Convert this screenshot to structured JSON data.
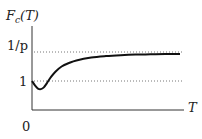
{
  "chart_data": {
    "type": "line",
    "title": "",
    "ylabel": "F_c(T)",
    "ylabel_main": "F",
    "ylabel_sub": "c",
    "ylabel_arg": "(T)",
    "xlabel": "T",
    "origin_label": "0",
    "ytick_labels": [
      "1",
      "1/p"
    ],
    "reference_lines": [
      {
        "label": "1",
        "y": 1.0,
        "style": "dotted"
      },
      {
        "label": "1/p",
        "y": 2.0,
        "style": "dotted"
      }
    ],
    "xlim": [
      0,
      10
    ],
    "ylim": [
      0,
      2.8
    ],
    "grid": false,
    "series": [
      {
        "name": "F_c(T)",
        "x": [
          0,
          0.2,
          0.4,
          0.6,
          0.8,
          1.0,
          1.3,
          1.6,
          2.0,
          2.5,
          3.0,
          4.0,
          5.0,
          6.0,
          7.0,
          8.0,
          9.0,
          10.0
        ],
        "y": [
          1.0,
          0.85,
          0.74,
          0.72,
          0.78,
          0.92,
          1.15,
          1.33,
          1.5,
          1.62,
          1.71,
          1.81,
          1.86,
          1.89,
          1.91,
          1.92,
          1.93,
          1.935
        ]
      }
    ]
  }
}
